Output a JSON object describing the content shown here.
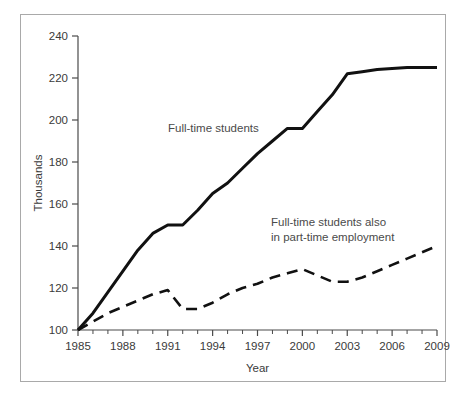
{
  "figure": {
    "border_color": "#a9a9a9",
    "background": "#ffffff",
    "line_color": "#111111",
    "text_color": "#3a3a3a"
  },
  "chart_data": {
    "type": "line",
    "title": "",
    "xlabel": "Year",
    "ylabel": "Thousands",
    "xlim": [
      1985,
      2009
    ],
    "ylim": [
      100,
      240
    ],
    "ytick_labels": [
      "100",
      "120",
      "140",
      "160",
      "180",
      "200",
      "220",
      "240"
    ],
    "yticks": [
      100,
      120,
      140,
      160,
      180,
      200,
      220,
      240
    ],
    "xtick_labels": [
      "1985",
      "1988",
      "1991",
      "1994",
      "1997",
      "2000",
      "2003",
      "2006",
      "2009"
    ],
    "xticks_major": [
      1985,
      1988,
      1991,
      1994,
      1997,
      2000,
      2003,
      2006,
      2009
    ],
    "xticks_minor": [
      1986,
      1987,
      1989,
      1990,
      1992,
      1993,
      1995,
      1996,
      1998,
      1999,
      2001,
      2002,
      2004,
      2005,
      2007,
      2008
    ],
    "grid": false,
    "legend_position": "inline-annotations",
    "x": [
      1985,
      1986,
      1987,
      1988,
      1989,
      1990,
      1991,
      1992,
      1993,
      1994,
      1995,
      1996,
      1997,
      1998,
      1999,
      2000,
      2001,
      2002,
      2003,
      2004,
      2005,
      2006,
      2007,
      2008,
      2009
    ],
    "series": [
      {
        "name": "Full-time students",
        "style": "solid",
        "label": "Full-time students",
        "values": [
          100,
          108,
          118,
          128,
          138,
          146,
          150,
          150,
          157,
          165,
          170,
          177,
          184,
          190,
          196,
          196,
          204,
          212,
          222,
          223,
          224,
          224.5,
          225,
          225,
          225
        ]
      },
      {
        "name": "Full-time students also in part-time employment",
        "style": "dashed",
        "label_line1": "Full-time students also",
        "label_line2": "in part-time employment",
        "values": [
          100,
          104,
          108,
          111,
          114,
          117,
          119,
          110,
          110,
          113,
          117,
          120,
          122,
          125,
          127,
          129,
          126,
          123,
          123,
          125,
          128,
          131,
          134,
          137,
          140
        ]
      }
    ]
  },
  "annotations": [
    {
      "name": "full-time-students-label",
      "text": "Full-time students"
    },
    {
      "name": "part-time-employment-label-line1",
      "text": "Full-time students also"
    },
    {
      "name": "part-time-employment-label-line2",
      "text": "in part-time employment"
    }
  ]
}
